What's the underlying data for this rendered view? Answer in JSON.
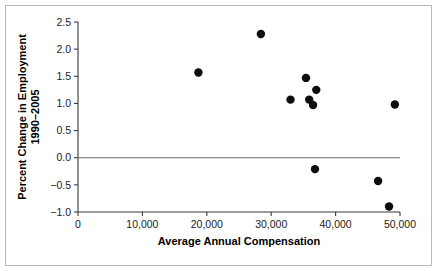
{
  "chart_data": {
    "type": "scatter",
    "title": "",
    "xlabel": "Average Annual Compensation",
    "ylabel": "Percent Change in Employment 1990–2005",
    "ylabel_line1": "Percent Change in Employment",
    "ylabel_line2": "1990–2005",
    "xlim": [
      0,
      50000
    ],
    "ylim": [
      -1.0,
      2.5
    ],
    "xticks": [
      0,
      10000,
      20000,
      30000,
      40000,
      50000
    ],
    "xtick_labels": [
      "0",
      "10,000",
      "20,000",
      "30,000",
      "40,000",
      "50,000"
    ],
    "yticks": [
      -1.0,
      -0.5,
      0.0,
      0.5,
      1.0,
      1.5,
      2.0,
      2.5
    ],
    "ytick_labels": [
      "−1.0",
      "−0.5",
      "0.0",
      "0.5",
      "1.0",
      "1.5",
      "2.0",
      "2.5"
    ],
    "grid": false,
    "legend": null,
    "reference_lines": [
      {
        "name": "zero-line",
        "orientation": "horizontal",
        "y": 0.0,
        "color": "#6f6f6f"
      }
    ],
    "marker": {
      "shape": "circle",
      "color": "#0d0d0d",
      "radius_px": 4.2
    },
    "points": [
      {
        "x": 18700,
        "y": 1.57
      },
      {
        "x": 28400,
        "y": 2.28
      },
      {
        "x": 33000,
        "y": 1.07
      },
      {
        "x": 35400,
        "y": 1.47
      },
      {
        "x": 35900,
        "y": 1.07
      },
      {
        "x": 37000,
        "y": 1.25
      },
      {
        "x": 36500,
        "y": 0.97
      },
      {
        "x": 36800,
        "y": -0.21
      },
      {
        "x": 46600,
        "y": -0.43
      },
      {
        "x": 48300,
        "y": -0.9
      },
      {
        "x": 49200,
        "y": 0.98
      }
    ],
    "colors": {
      "marker": "#0d0d0d",
      "axis": "#3a3a3a",
      "zero_line": "#6f6f6f",
      "frame_border": "#b9b9b9",
      "background": "#ffffff",
      "text": "#000000"
    }
  }
}
